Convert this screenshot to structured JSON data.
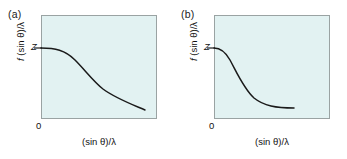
{
  "figure": {
    "background": "#ffffff",
    "plot_background": "#e2f2f2",
    "frame_color": "#9aa3a3",
    "curve_color": "#1a1a1a"
  },
  "panels": [
    {
      "label": "(a)",
      "ylabel_prefix": "f",
      "ylabel_body": " (sin θ)/λ",
      "xlabel_body": "(sin θ)/λ",
      "origin_tick": "0",
      "y_tick": "Z",
      "curve_path": "M 0,33 C 14,33 24,35 34,45 C 44,55 52,66 62,74 C 74,83 90,89 104,95"
    },
    {
      "label": "(b)",
      "ylabel_prefix": "f",
      "ylabel_body": " (sin θ)/λ",
      "xlabel_body": "(sin θ)/λ",
      "origin_tick": "0",
      "y_tick": "Z",
      "curve_path": "M 0,33 C 6,33 11,36 16,45 C 23,58 30,74 40,83 C 50,91 62,93 80,93"
    }
  ],
  "chart_data": {
    "type": "line",
    "title": "",
    "xlabel": "(sin θ)/λ",
    "ylabel": "f (sin θ)/λ",
    "grid": false,
    "legend": null,
    "xlim": [
      0,
      1
    ],
    "ylim": [
      0,
      1
    ],
    "y_tick_labels": [
      "Z"
    ],
    "x_tick_labels": [
      "0"
    ],
    "series": [
      {
        "name": "(a) diffuse atom scattering factor",
        "panel": "(a)",
        "x": [
          0.0,
          0.1,
          0.2,
          0.3,
          0.4,
          0.5,
          0.6,
          0.7,
          0.8,
          0.9
        ],
        "y": [
          1.0,
          0.98,
          0.93,
          0.83,
          0.71,
          0.59,
          0.49,
          0.41,
          0.34,
          0.28
        ]
      },
      {
        "name": "(b) compact atom scattering factor",
        "panel": "(b)",
        "x": [
          0.0,
          0.08,
          0.16,
          0.24,
          0.32,
          0.4,
          0.5,
          0.6,
          0.7
        ],
        "y": [
          1.0,
          0.95,
          0.8,
          0.58,
          0.38,
          0.24,
          0.15,
          0.12,
          0.11
        ]
      }
    ]
  }
}
